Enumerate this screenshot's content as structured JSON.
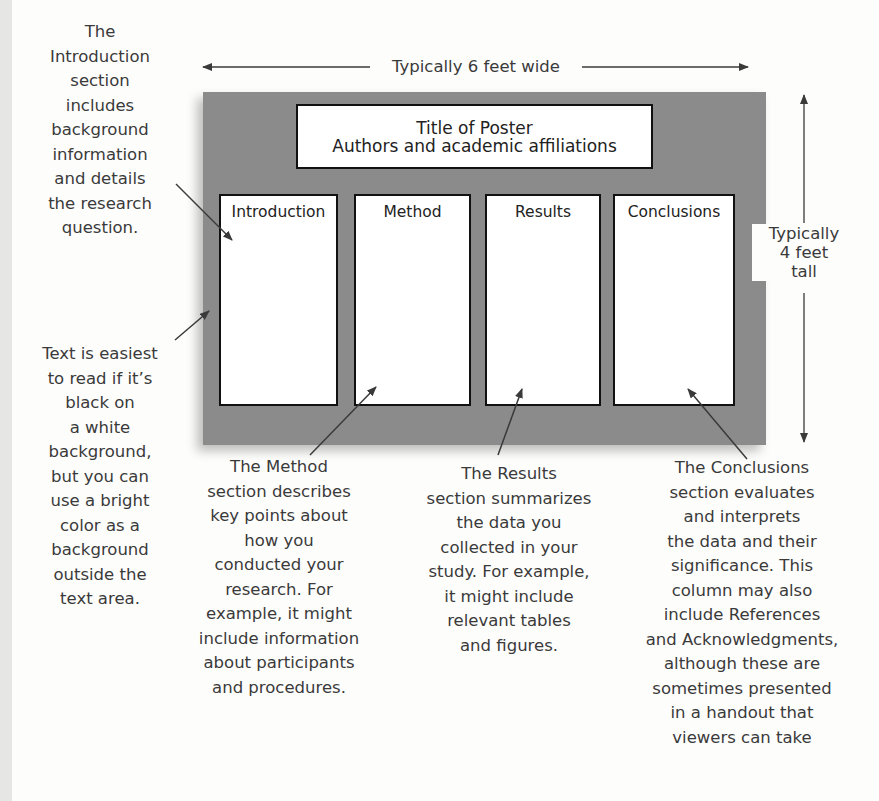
{
  "poster": {
    "title": "Title of Poster",
    "subtitle": "Authors and academic affiliations",
    "width_label": "Typically 6 feet wide",
    "height_label": "Typically\n4 feet\ntall",
    "columns": [
      {
        "heading": "Introduction"
      },
      {
        "heading": "Method"
      },
      {
        "heading": "Results"
      },
      {
        "heading": "Conclusions"
      }
    ],
    "board_color": "#8b8b8b"
  },
  "annotations": {
    "introduction": "The\nIntroduction\nsection\nincludes\nbackground\ninformation\nand details\nthe research\nquestion.",
    "background": "Text is easiest\nto read if it’s\nblack on\na white\nbackground,\nbut you can\nuse a bright\ncolor as a\nbackground\noutside the\ntext area.",
    "method": "The Method\nsection describes\nkey points about\nhow you\nconducted your\nresearch. For\nexample, it might\ninclude information\nabout participants\nand procedures.",
    "results": "The Results\nsection summarizes\nthe data you\ncollected in your\nstudy. For example,\nit might include\nrelevant tables\nand figures.",
    "conclusions": "The Conclusions\nsection evaluates\nand interprets\nthe data and their\nsignificance. This\ncolumn may also\ninclude References\nand Acknowledgments,\nalthough these are\nsometimes presented\nin a handout that\nviewers can take"
  }
}
